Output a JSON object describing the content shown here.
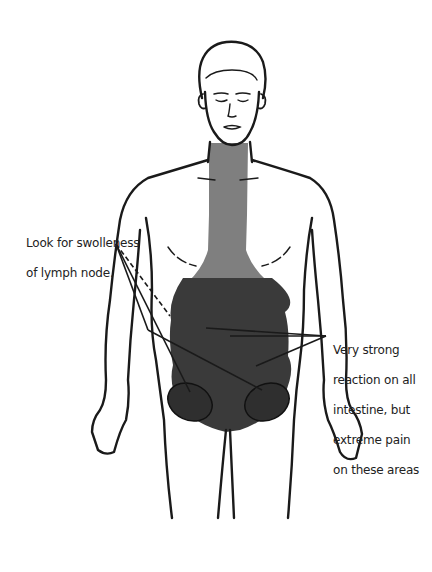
{
  "diagram": {
    "colors": {
      "outline": "#1a1a1a",
      "neck_chest_zone": "#7f7f7f",
      "abdomen_zone": "#3a3a3a",
      "background": "#ffffff"
    },
    "annotations": [
      {
        "id": "lymph-node",
        "text_lines": [
          "Look for swolleness",
          "of lymph node."
        ],
        "points_to": "left and right groin lymph nodes"
      },
      {
        "id": "intestine",
        "text_lines": [
          "Very strong",
          "reaction on all",
          "intestine, but",
          "extreme pain",
          "on these areas"
        ],
        "points_to": "three areas of the abdomen"
      }
    ]
  }
}
